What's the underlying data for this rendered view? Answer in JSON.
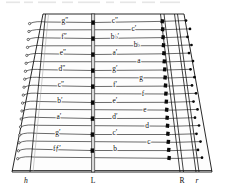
{
  "figure": {
    "kind": "instrument-string-layout-diagram",
    "ink_color": "#111111",
    "paper_color": "#ffffff",
    "bridge_pin_color": "#0a0a0a",
    "rail_fill_color": "#d8d8d8"
  },
  "axis_markers": [
    {
      "id": "left-rail",
      "label": "h",
      "style": "italic"
    },
    {
      "id": "center-bridge",
      "label": "L",
      "style": "cap"
    },
    {
      "id": "right-rail-main",
      "label": "R",
      "style": "cap"
    },
    {
      "id": "right-rail-aux",
      "label": "r",
      "style": "italic"
    }
  ],
  "left_column_labels": [
    {
      "row": 1,
      "text": "g″"
    },
    {
      "row": 3,
      "text": "f″"
    },
    {
      "row": 5,
      "text": "e″"
    },
    {
      "row": 7,
      "text": "d″"
    },
    {
      "row": 9,
      "text": "c″"
    },
    {
      "row": 11,
      "text": "b′"
    },
    {
      "row": 13,
      "text": "a′"
    },
    {
      "row": 15,
      "text": "g′"
    },
    {
      "row": 17,
      "text": "fƒ′"
    }
  ],
  "right_column_labels": [
    {
      "row": 1,
      "text": "c″"
    },
    {
      "row": 2,
      "text": "c′"
    },
    {
      "row": 3,
      "text": "b♭′"
    },
    {
      "row": 4,
      "text": "b♭"
    },
    {
      "row": 5,
      "text": "a′"
    },
    {
      "row": 6,
      "text": "a"
    },
    {
      "row": 7,
      "text": "g′"
    },
    {
      "row": 8,
      "text": "g"
    },
    {
      "row": 9,
      "text": "f′"
    },
    {
      "row": 10,
      "text": "f"
    },
    {
      "row": 11,
      "text": "e′"
    },
    {
      "row": 12,
      "text": "e"
    },
    {
      "row": 13,
      "text": "d′"
    },
    {
      "row": 14,
      "text": "d"
    },
    {
      "row": 15,
      "text": "c′"
    },
    {
      "row": 16,
      "text": "c"
    },
    {
      "row": 17,
      "text": "b"
    }
  ],
  "string_rows": [
    {
      "row": 1,
      "y": 22.5,
      "terminates_on_bridge": true
    },
    {
      "row": 2,
      "y": 30.5,
      "terminates_on_bridge": false
    },
    {
      "row": 3,
      "y": 38.5,
      "terminates_on_bridge": true
    },
    {
      "row": 4,
      "y": 46.5,
      "terminates_on_bridge": false
    },
    {
      "row": 5,
      "y": 54.5,
      "terminates_on_bridge": true
    },
    {
      "row": 6,
      "y": 62.5,
      "terminates_on_bridge": false
    },
    {
      "row": 7,
      "y": 70.5,
      "terminates_on_bridge": true
    },
    {
      "row": 8,
      "y": 78.5,
      "terminates_on_bridge": false
    },
    {
      "row": 9,
      "y": 86.5,
      "terminates_on_bridge": true
    },
    {
      "row": 10,
      "y": 94.5,
      "terminates_on_bridge": false
    },
    {
      "row": 11,
      "y": 102.5,
      "terminates_on_bridge": true
    },
    {
      "row": 12,
      "y": 110.5,
      "terminates_on_bridge": false
    },
    {
      "row": 13,
      "y": 118.5,
      "terminates_on_bridge": true
    },
    {
      "row": 14,
      "y": 126.5,
      "terminates_on_bridge": false
    },
    {
      "row": 15,
      "y": 134.5,
      "terminates_on_bridge": true
    },
    {
      "row": 16,
      "y": 142.5,
      "terminates_on_bridge": false
    },
    {
      "row": 17,
      "y": 150.5,
      "terminates_on_bridge": true
    },
    {
      "row": 18,
      "y": 158.5,
      "terminates_on_bridge": false
    }
  ]
}
